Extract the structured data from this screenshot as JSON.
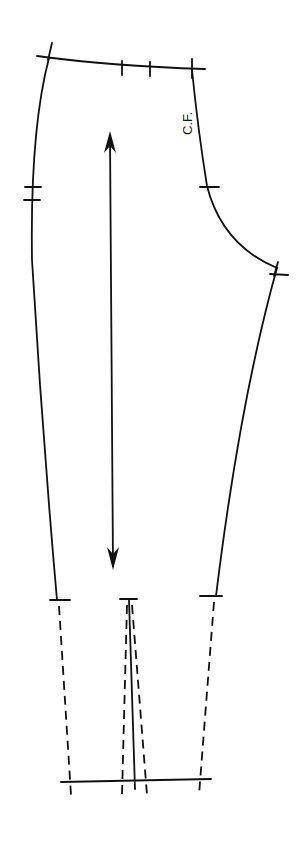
{
  "diagram": {
    "type": "sewing-pattern",
    "piece": "trouser front",
    "labels": {
      "center_front": "C.F."
    },
    "annotations": {
      "grainline": "double-headed grain line arrow",
      "notches": [
        "waist left corner",
        "waist double mark",
        "waist right corner",
        "side seam double notch",
        "center front notch",
        "crotch point",
        "knee line notches (3)"
      ],
      "extension": "dashed lower leg extension to hem line"
    },
    "colors": {
      "background": "#ffffff",
      "line": "#111111"
    }
  }
}
